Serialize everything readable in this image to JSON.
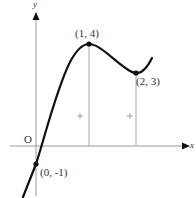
{
  "diagram": {
    "type": "function-graph",
    "axes": {
      "x_label": "x",
      "y_label": "y",
      "origin_label": "O"
    },
    "points": [
      {
        "label": "(1, 4)",
        "x": 1,
        "y": 4,
        "kind": "local-maximum"
      },
      {
        "label": "(2, 3)",
        "x": 2,
        "y": 3,
        "kind": "local-minimum"
      },
      {
        "label": "(0, -1)",
        "x": 0,
        "y": -1,
        "kind": "y-intercept"
      }
    ],
    "tick_marks": [
      "+",
      "+"
    ],
    "colors": {
      "curve": "#111111",
      "axis": "#999999",
      "guide": "#aaaaaa",
      "text": "#333333"
    }
  }
}
